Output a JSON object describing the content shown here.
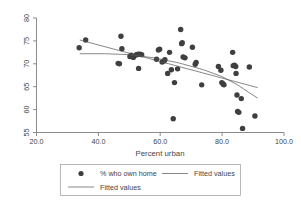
{
  "chart_data": {
    "type": "scatter",
    "title": "",
    "xlabel": "Percent urban",
    "ylabel": "",
    "xlim": [
      20.0,
      100.0
    ],
    "ylim": [
      55,
      80
    ],
    "grid": false,
    "xticks": [
      "20.0",
      "40.0",
      "60.0",
      "80.0",
      "100.0"
    ],
    "xtick_values": [
      20,
      40,
      60,
      80,
      100
    ],
    "yticks": [
      "55",
      "60",
      "65",
      "70",
      "75",
      "80"
    ],
    "ytick_values": [
      55,
      60,
      65,
      70,
      75,
      80
    ],
    "legend_position": "below-plot",
    "series": [
      {
        "name": "% who own home",
        "type": "scatter",
        "marker": "filled-circle",
        "color": "#3f3f3f",
        "points": [
          [
            33.8,
            73.5
          ],
          [
            35.9,
            75.2
          ],
          [
            46.4,
            70.1
          ],
          [
            46.8,
            70.0
          ],
          [
            47.3,
            76.0
          ],
          [
            47.6,
            73.3
          ],
          [
            50.2,
            71.6
          ],
          [
            50.6,
            71.9
          ],
          [
            51.3,
            71.4
          ],
          [
            52.1,
            71.9
          ],
          [
            52.4,
            72.0
          ],
          [
            52.8,
            72.1
          ],
          [
            53.0,
            69.0
          ],
          [
            53.5,
            72.1
          ],
          [
            54.0,
            72.0
          ],
          [
            58.8,
            71.0
          ],
          [
            59.4,
            73.0
          ],
          [
            59.8,
            73.2
          ],
          [
            60.6,
            70.4
          ],
          [
            61.2,
            70.6
          ],
          [
            61.5,
            70.9
          ],
          [
            62.4,
            67.9
          ],
          [
            63.0,
            72.5
          ],
          [
            63.6,
            68.7
          ],
          [
            64.2,
            58.0
          ],
          [
            64.6,
            65.9
          ],
          [
            65.6,
            68.9
          ],
          [
            66.6,
            77.5
          ],
          [
            66.9,
            74.4
          ],
          [
            67.1,
            74.6
          ],
          [
            67.4,
            71.5
          ],
          [
            68.0,
            71.3
          ],
          [
            70.4,
            73.6
          ],
          [
            71.3,
            69.9
          ],
          [
            71.6,
            70.3
          ],
          [
            73.4,
            65.4
          ],
          [
            78.8,
            69.4
          ],
          [
            79.6,
            68.6
          ],
          [
            79.9,
            65.9
          ],
          [
            80.3,
            65.6
          ],
          [
            80.6,
            65.4
          ],
          [
            83.4,
            72.5
          ],
          [
            83.6,
            69.6
          ],
          [
            84.0,
            69.7
          ],
          [
            84.4,
            69.4
          ],
          [
            84.5,
            67.9
          ],
          [
            84.8,
            63.2
          ],
          [
            85.0,
            59.6
          ],
          [
            85.4,
            59.4
          ],
          [
            86.2,
            62.4
          ],
          [
            86.6,
            55.9
          ],
          [
            88.8,
            69.3
          ],
          [
            90.6,
            58.6
          ]
        ]
      },
      {
        "name": "Fitted values",
        "type": "line",
        "style": "straight",
        "color": "#555555",
        "points": [
          [
            34.0,
            75.2
          ],
          [
            91.5,
            64.8
          ]
        ]
      },
      {
        "name": "Fitted values",
        "type": "line",
        "style": "curved",
        "color": "#555555",
        "points": [
          [
            34.0,
            72.2
          ],
          [
            42.0,
            72.2
          ],
          [
            50.0,
            72.0
          ],
          [
            58.0,
            71.3
          ],
          [
            66.0,
            70.2
          ],
          [
            74.0,
            68.7
          ],
          [
            80.0,
            67.2
          ],
          [
            85.0,
            65.4
          ],
          [
            88.5,
            63.8
          ],
          [
            91.5,
            62.5
          ]
        ]
      }
    ]
  },
  "legend": {
    "entries": [
      {
        "label": "% who own home",
        "marker": "filled-circle"
      },
      {
        "label": "Fitted values",
        "marker": "line"
      },
      {
        "label": "Fitted values",
        "marker": "line"
      }
    ]
  }
}
